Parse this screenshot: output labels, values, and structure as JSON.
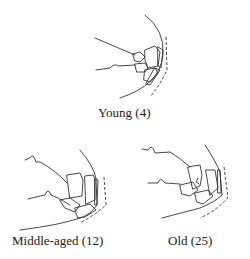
{
  "figure": {
    "panels": [
      {
        "label": "Young (4)"
      },
      {
        "label": "Middle-aged (12)"
      },
      {
        "label": "Old (25)"
      }
    ]
  }
}
